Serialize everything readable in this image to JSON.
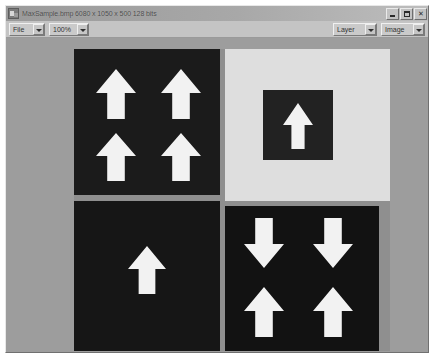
{
  "window": {
    "title": "MaxSample.bmp  6080 x 1050 x 500 128 bits",
    "icon": "app-icon",
    "controls": {
      "minimize_label": "_",
      "maximize_label": "□",
      "close_label": "✕"
    }
  },
  "toolbar": {
    "file_menu": {
      "label": "File",
      "arrow": "chevron-down-icon"
    },
    "zoom_level": {
      "label": "100%",
      "arrow": "chevron-down-icon"
    },
    "layer_select": {
      "label": "Layer",
      "arrow": "chevron-down-icon"
    },
    "image_select": {
      "label": "Image",
      "arrow": "chevron-down-icon"
    }
  },
  "canvas": {
    "background_color": "#9d9d9d",
    "document": {
      "quadrants": [
        {
          "name": "top-left",
          "background_color": "#1b1b1b",
          "arrow_color": "#f2f2f2",
          "arrow_count": 4,
          "arrows": [
            {
              "direction": "up"
            },
            {
              "direction": "up"
            },
            {
              "direction": "up"
            },
            {
              "direction": "up"
            }
          ]
        },
        {
          "name": "top-right",
          "background_color": "#dedede",
          "inner_square_color": "#222222",
          "arrow_color": "#f2f2f2",
          "arrow_count": 1,
          "arrows": [
            {
              "direction": "up"
            }
          ]
        },
        {
          "name": "bottom-left",
          "background_color": "#161616",
          "arrow_color": "#f2f2f2",
          "arrow_count": 1,
          "arrows": [
            {
              "direction": "up"
            }
          ]
        },
        {
          "name": "bottom-right",
          "background_color": "#121212",
          "arrow_color": "#f2f2f2",
          "arrow_count": 4,
          "arrows": [
            {
              "direction": "down"
            },
            {
              "direction": "down"
            },
            {
              "direction": "up"
            },
            {
              "direction": "up"
            }
          ]
        }
      ]
    }
  }
}
